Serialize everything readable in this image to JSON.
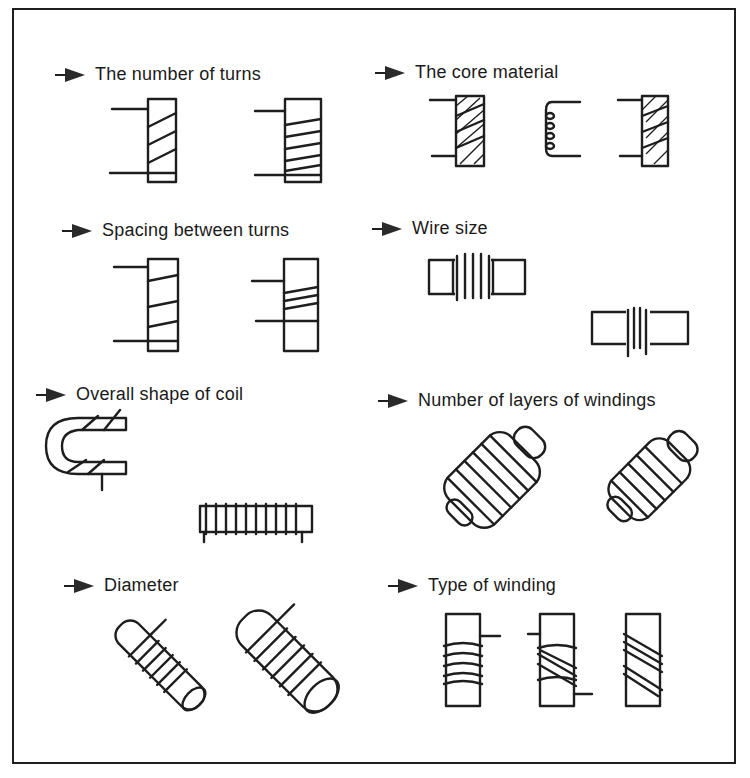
{
  "diagram": {
    "title_hidden": "",
    "sections": [
      {
        "id": "turns",
        "label": "The number of turns"
      },
      {
        "id": "core",
        "label": "The core material"
      },
      {
        "id": "spacing",
        "label": "Spacing between turns"
      },
      {
        "id": "wire",
        "label": "Wire size"
      },
      {
        "id": "shape",
        "label": "Overall shape of coil"
      },
      {
        "id": "layers",
        "label": "Number of layers of windings"
      },
      {
        "id": "diameter",
        "label": "Diameter"
      },
      {
        "id": "winding",
        "label": "Type of winding"
      }
    ],
    "colors": {
      "ink": "#1e1e1e",
      "background": "#ffffff"
    }
  }
}
